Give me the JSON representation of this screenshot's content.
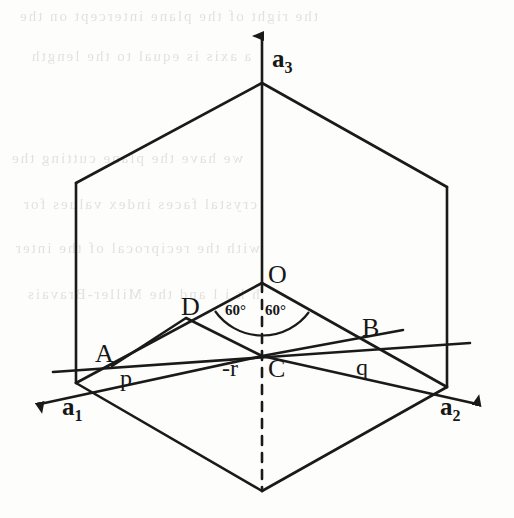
{
  "figure": {
    "stroke_color": "#1a1a1a",
    "background_color": "#fdfdfb",
    "width": 514,
    "height": 518
  },
  "axes": [
    {
      "id": "a1",
      "label": "a",
      "subscript": "1",
      "direction": "lower-left",
      "arrow": true
    },
    {
      "id": "a2",
      "label": "a",
      "subscript": "2",
      "direction": "lower-right",
      "arrow": true
    },
    {
      "id": "a3",
      "label": "a",
      "subscript": "3",
      "direction": "up",
      "arrow": true
    }
  ],
  "points": [
    {
      "id": "O",
      "label": "O"
    },
    {
      "id": "D",
      "label": "D"
    },
    {
      "id": "B",
      "label": "B"
    },
    {
      "id": "A",
      "label": "A"
    },
    {
      "id": "C",
      "label": "C"
    },
    {
      "id": "p",
      "label": "p"
    },
    {
      "id": "q",
      "label": "q"
    },
    {
      "id": "negr",
      "label": "-r"
    }
  ],
  "angles": [
    {
      "id": "angle-left",
      "label": "60°"
    },
    {
      "id": "angle-right",
      "label": "60°"
    }
  ],
  "ghost_text": [
    "the right of the plane intercept on the",
    "a  axis  is  equal  to  the  length",
    "we  have  the  plane  cutting  the",
    "crystal  faces  index  values  for",
    "with  the  reciprocal  of  the  inter",
    "ħ k  i  l  and  the  Miller-Bravais"
  ]
}
